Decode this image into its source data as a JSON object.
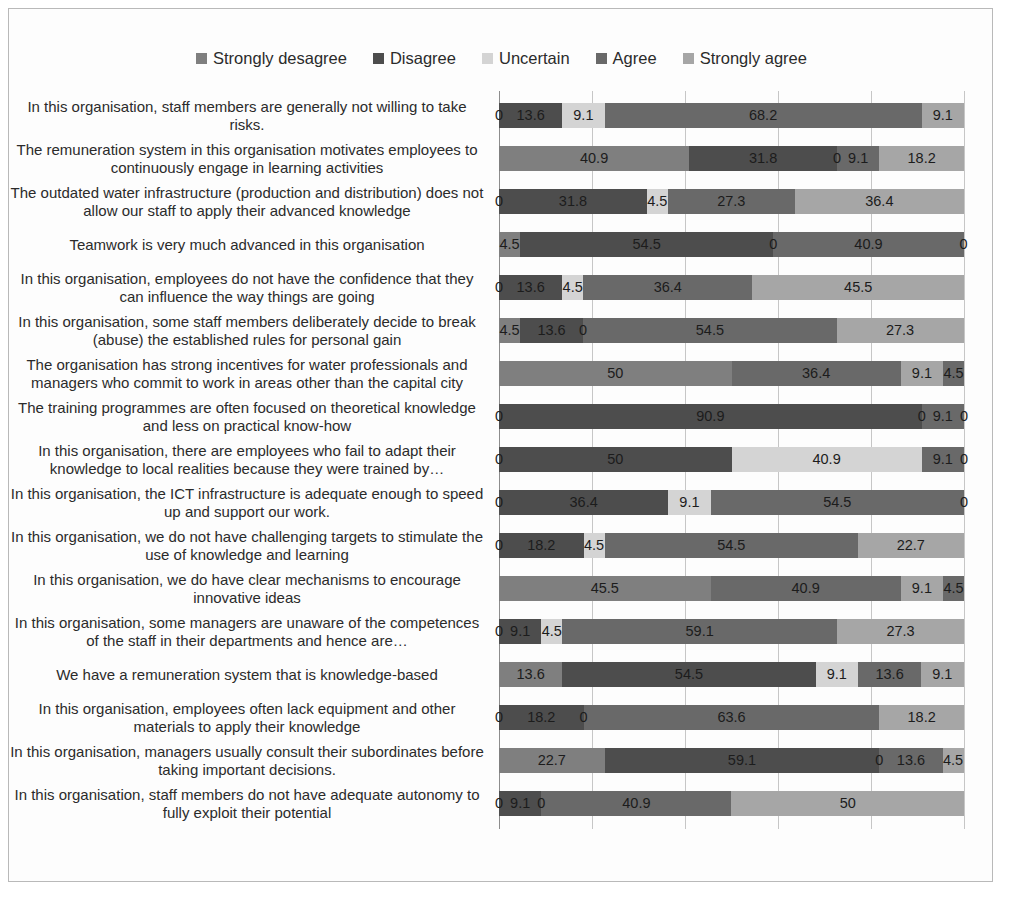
{
  "legend": {
    "items": [
      {
        "label": "Strongly desagree",
        "color": "#7f7f7f"
      },
      {
        "label": "Disagree",
        "color": "#4d4d4d"
      },
      {
        "label": "Uncertain",
        "color": "#d4d4d4"
      },
      {
        "label": "Agree",
        "color": "#696969"
      },
      {
        "label": "Strongly agree",
        "color": "#a6a6a6"
      }
    ]
  },
  "axis": {
    "ticks": [
      "0%",
      "20%",
      "40%",
      "60%",
      "80%",
      "100%"
    ],
    "tick_values": [
      0,
      20,
      40,
      60,
      80,
      100
    ]
  },
  "chart_data": {
    "type": "bar",
    "orientation": "horizontal",
    "stacked": true,
    "stack_mode": "percent",
    "title": "",
    "xlabel": "",
    "ylabel": "",
    "xlim": [
      0,
      100
    ],
    "grid": true,
    "legend_position": "top",
    "tick_labels": [
      "0%",
      "20%",
      "40%",
      "60%",
      "80%",
      "100%"
    ],
    "series": [
      {
        "name": "Strongly desagree",
        "color": "#7f7f7f",
        "values": [
          0,
          40.9,
          0,
          4.5,
          0,
          4.5,
          50,
          0,
          0,
          0,
          0,
          45.5,
          0,
          13.6,
          0,
          22.7,
          0
        ]
      },
      {
        "name": "Disagree",
        "color": "#4d4d4d",
        "values": [
          13.6,
          31.8,
          31.8,
          54.5,
          13.6,
          13.6,
          0,
          90.9,
          50,
          36.4,
          18.2,
          0,
          9.1,
          54.5,
          18.2,
          59.1,
          9.1
        ]
      },
      {
        "name": "Uncertain",
        "color": "#d4d4d4",
        "values": [
          9.1,
          0,
          4.5,
          0,
          4.5,
          0,
          0,
          0,
          40.9,
          9.1,
          4.5,
          0,
          4.5,
          9.1,
          0,
          0,
          0
        ]
      },
      {
        "name": "Agree",
        "color": "#696969",
        "values": [
          68.2,
          9.1,
          27.3,
          40.9,
          36.4,
          54.5,
          36.4,
          9.1,
          9.1,
          54.5,
          54.5,
          40.9,
          59.1,
          13.6,
          63.6,
          13.6,
          40.9
        ]
      },
      {
        "name": "Strongly agree",
        "color": "#a6a6a6",
        "values": [
          9.1,
          18.2,
          36.4,
          0,
          45.5,
          27.3,
          9.1,
          0,
          0,
          0,
          22.7,
          9.1,
          27.3,
          9.1,
          18.2,
          4.5,
          50
        ]
      }
    ],
    "extra_series": [
      {
        "name": "trailing",
        "color": "#696969",
        "values": [
          0,
          0,
          0,
          0,
          0,
          0,
          4.5,
          0,
          0,
          0,
          0,
          4.5,
          0,
          0,
          0,
          4.5,
          0
        ]
      }
    ],
    "categories": [
      "In this organisation, staff members are generally not willing to take risks.",
      "The remuneration system in this organisation motivates employees to continuously engage in learning activities",
      "The outdated water infrastructure (production and distribution) does not allow our staff to apply their advanced knowledge",
      "Teamwork is very much advanced in this organisation",
      "In this organisation, employees do not have the confidence that they can influence the way things are going",
      "In this organisation, some staff members deliberately decide to break (abuse) the established rules for personal gain",
      "The organisation has strong incentives for water professionals and managers who commit to work in areas other than the capital city",
      "The training programmes are often focused on theoretical knowledge and less on practical know-how",
      "In this organisation, there are employees who fail to adapt their knowledge to local realities because they were trained by…",
      "In this organisation, the ICT infrastructure is adequate enough to speed up and support our work.",
      "In this organisation, we do not have challenging targets to stimulate the use of knowledge and learning",
      "In this organisation, we do have clear mechanisms to encourage innovative ideas",
      "In this organisation, some managers are unaware of the competences of the staff in their departments and hence are…",
      "We have a remuneration system that is knowledge-based",
      "In this organisation, employees often lack equipment and other materials to apply their knowledge",
      "In this organisation, managers usually consult their subordinates before taking important decisions.",
      "In this organisation, staff members do not have adequate autonomy to fully exploit their potential"
    ],
    "rows": [
      {
        "label": "In this organisation, staff members are generally not willing to take risks.",
        "segments": [
          {
            "series": "Strongly desagree",
            "value": 0,
            "display": "0"
          },
          {
            "series": "Disagree",
            "value": 13.6,
            "display": "13.6"
          },
          {
            "series": "Uncertain",
            "value": 9.1,
            "display": "9.1"
          },
          {
            "series": "Agree",
            "value": 68.2,
            "display": "68.2"
          },
          {
            "series": "Strongly agree",
            "value": 9.1,
            "display": "9.1"
          }
        ]
      },
      {
        "label": "The remuneration system in this organisation motivates employees to continuously engage in learning activities",
        "segments": [
          {
            "series": "Strongly desagree",
            "value": 40.9,
            "display": "40.9"
          },
          {
            "series": "Disagree",
            "value": 31.8,
            "display": "31.8"
          },
          {
            "series": "Uncertain",
            "value": 0,
            "display": "0"
          },
          {
            "series": "Agree",
            "value": 9.1,
            "display": "9.1"
          },
          {
            "series": "Strongly agree",
            "value": 18.2,
            "display": "18.2"
          }
        ]
      },
      {
        "label": "The outdated water infrastructure (production and distribution) does not allow our staff to apply their advanced knowledge",
        "segments": [
          {
            "series": "Strongly desagree",
            "value": 0,
            "display": "0"
          },
          {
            "series": "Disagree",
            "value": 31.8,
            "display": "31.8"
          },
          {
            "series": "Uncertain",
            "value": 4.5,
            "display": "4.5"
          },
          {
            "series": "Agree",
            "value": 27.3,
            "display": "27.3"
          },
          {
            "series": "Strongly agree",
            "value": 36.4,
            "display": "36.4"
          }
        ]
      },
      {
        "label": "Teamwork is very much advanced in this organisation",
        "segments": [
          {
            "series": "Strongly desagree",
            "value": 4.5,
            "display": "4.5"
          },
          {
            "series": "Disagree",
            "value": 54.5,
            "display": "54.5"
          },
          {
            "series": "Uncertain",
            "value": 0,
            "display": "0"
          },
          {
            "series": "Agree",
            "value": 40.9,
            "display": "40.9"
          },
          {
            "series": "Strongly agree",
            "value": 0,
            "display": "0"
          }
        ]
      },
      {
        "label": "In this organisation, employees do not have the confidence that they can influence the way things are going",
        "segments": [
          {
            "series": "Strongly desagree",
            "value": 0,
            "display": "0"
          },
          {
            "series": "Disagree",
            "value": 13.6,
            "display": "13.6"
          },
          {
            "series": "Uncertain",
            "value": 4.5,
            "display": "4.5"
          },
          {
            "series": "Agree",
            "value": 36.4,
            "display": "36.4"
          },
          {
            "series": "Strongly agree",
            "value": 45.5,
            "display": "45.5"
          }
        ]
      },
      {
        "label": "In this organisation, some staff members deliberately decide to break (abuse) the established rules for personal gain",
        "segments": [
          {
            "series": "Strongly desagree",
            "value": 4.5,
            "display": "4.5"
          },
          {
            "series": "Disagree",
            "value": 13.6,
            "display": "13.6"
          },
          {
            "series": "Uncertain",
            "value": 0,
            "display": "0"
          },
          {
            "series": "Agree",
            "value": 54.5,
            "display": "54.5"
          },
          {
            "series": "Strongly agree",
            "value": 27.3,
            "display": "27.3"
          }
        ]
      },
      {
        "label": "The organisation has strong incentives for water professionals and managers who commit to work in areas other than the capital city",
        "segments": [
          {
            "series": "Strongly desagree",
            "value": 50,
            "display": "50"
          },
          {
            "series": "Disagree",
            "value": 0,
            "display": ""
          },
          {
            "series": "Uncertain",
            "value": 0,
            "display": ""
          },
          {
            "series": "Agree",
            "value": 36.4,
            "display": "36.4"
          },
          {
            "series": "Strongly agree",
            "value": 9.1,
            "display": "9.1"
          },
          {
            "series": "Agree",
            "value": 4.5,
            "display": "4.5"
          }
        ]
      },
      {
        "label": "The training programmes are often focused on theoretical knowledge and less on practical know-how",
        "segments": [
          {
            "series": "Strongly desagree",
            "value": 0,
            "display": "0"
          },
          {
            "series": "Disagree",
            "value": 90.9,
            "display": "90.9"
          },
          {
            "series": "Uncertain",
            "value": 0,
            "display": "0"
          },
          {
            "series": "Agree",
            "value": 9.1,
            "display": "9.1"
          },
          {
            "series": "Strongly agree",
            "value": 0,
            "display": "0"
          }
        ]
      },
      {
        "label": "In this organisation, there are employees who fail to adapt their knowledge to local realities because they were trained by…",
        "segments": [
          {
            "series": "Strongly desagree",
            "value": 0,
            "display": "0"
          },
          {
            "series": "Disagree",
            "value": 50,
            "display": "50"
          },
          {
            "series": "Uncertain",
            "value": 40.9,
            "display": "40.9"
          },
          {
            "series": "Agree",
            "value": 9.1,
            "display": "9.1"
          },
          {
            "series": "Strongly agree",
            "value": 0,
            "display": "0"
          }
        ]
      },
      {
        "label": "In this organisation, the ICT infrastructure is adequate enough to speed up and support our work.",
        "segments": [
          {
            "series": "Strongly desagree",
            "value": 0,
            "display": "0"
          },
          {
            "series": "Disagree",
            "value": 36.4,
            "display": "36.4"
          },
          {
            "series": "Uncertain",
            "value": 9.1,
            "display": "9.1"
          },
          {
            "series": "Agree",
            "value": 54.5,
            "display": "54.5"
          },
          {
            "series": "Strongly agree",
            "value": 0,
            "display": "0"
          }
        ]
      },
      {
        "label": "In this organisation, we do not have challenging targets to stimulate the use of knowledge and learning",
        "segments": [
          {
            "series": "Strongly desagree",
            "value": 0,
            "display": "0"
          },
          {
            "series": "Disagree",
            "value": 18.2,
            "display": "18.2"
          },
          {
            "series": "Uncertain",
            "value": 4.5,
            "display": "4.5"
          },
          {
            "series": "Agree",
            "value": 54.5,
            "display": "54.5"
          },
          {
            "series": "Strongly agree",
            "value": 22.7,
            "display": "22.7"
          }
        ]
      },
      {
        "label": "In this organisation, we do have clear mechanisms to encourage innovative ideas",
        "segments": [
          {
            "series": "Strongly desagree",
            "value": 45.5,
            "display": "45.5"
          },
          {
            "series": "Disagree",
            "value": 0,
            "display": ""
          },
          {
            "series": "Uncertain",
            "value": 0,
            "display": ""
          },
          {
            "series": "Agree",
            "value": 40.9,
            "display": "40.9"
          },
          {
            "series": "Strongly agree",
            "value": 9.1,
            "display": "9.1"
          },
          {
            "series": "Agree",
            "value": 4.5,
            "display": "4.5"
          }
        ]
      },
      {
        "label": "In this organisation, some managers are unaware of the competences of the staff in their departments and hence are…",
        "segments": [
          {
            "series": "Strongly desagree",
            "value": 0,
            "display": "0"
          },
          {
            "series": "Disagree",
            "value": 9.1,
            "display": "9.1"
          },
          {
            "series": "Uncertain",
            "value": 4.5,
            "display": "4.5"
          },
          {
            "series": "Agree",
            "value": 59.1,
            "display": "59.1"
          },
          {
            "series": "Strongly agree",
            "value": 27.3,
            "display": "27.3"
          }
        ]
      },
      {
        "label": "We have a remuneration system that is knowledge-based",
        "segments": [
          {
            "series": "Strongly desagree",
            "value": 13.6,
            "display": "13.6"
          },
          {
            "series": "Disagree",
            "value": 54.5,
            "display": "54.5"
          },
          {
            "series": "Uncertain",
            "value": 9.1,
            "display": "9.1"
          },
          {
            "series": "Agree",
            "value": 13.6,
            "display": "13.6"
          },
          {
            "series": "Strongly agree",
            "value": 9.1,
            "display": "9.1"
          }
        ]
      },
      {
        "label": "In this organisation, employees often lack equipment and other materials to apply their knowledge",
        "segments": [
          {
            "series": "Strongly desagree",
            "value": 0,
            "display": "0"
          },
          {
            "series": "Disagree",
            "value": 18.2,
            "display": "18.2"
          },
          {
            "series": "Uncertain",
            "value": 0,
            "display": "0"
          },
          {
            "series": "Agree",
            "value": 63.6,
            "display": "63.6"
          },
          {
            "series": "Strongly agree",
            "value": 18.2,
            "display": "18.2"
          }
        ]
      },
      {
        "label": "In this organisation, managers usually consult their subordinates before taking important decisions.",
        "segments": [
          {
            "series": "Strongly desagree",
            "value": 22.7,
            "display": "22.7"
          },
          {
            "series": "Disagree",
            "value": 59.1,
            "display": "59.1"
          },
          {
            "series": "Uncertain",
            "value": 0,
            "display": "0"
          },
          {
            "series": "Agree",
            "value": 13.6,
            "display": "13.6"
          },
          {
            "series": "Strongly agree",
            "value": 4.5,
            "display": "4.5"
          }
        ]
      },
      {
        "label": "In this organisation, staff members do not have adequate autonomy to fully exploit their potential",
        "segments": [
          {
            "series": "Strongly desagree",
            "value": 0,
            "display": "0"
          },
          {
            "series": "Disagree",
            "value": 9.1,
            "display": "9.1"
          },
          {
            "series": "Uncertain",
            "value": 0,
            "display": "0"
          },
          {
            "series": "Agree",
            "value": 40.9,
            "display": "40.9"
          },
          {
            "series": "Strongly agree",
            "value": 50,
            "display": "50"
          }
        ]
      }
    ]
  }
}
